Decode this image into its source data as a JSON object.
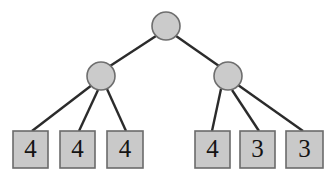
{
  "figure": {
    "name": "game-tree",
    "width": 334,
    "height": 177,
    "background_color": "#ffffff"
  },
  "style": {
    "node_fill": "#cbcbcb",
    "node_stroke": "#6e6e6e",
    "leaf_fill": "#c9c9c9",
    "leaf_stroke": "#6b6b6b",
    "edge_color": "#2b2b2b",
    "label_color": "#141414"
  },
  "nodes": {
    "root": {
      "id": "root",
      "shape": "circle",
      "cx": 166,
      "cy": 26,
      "r": 14,
      "label": ""
    },
    "internal": [
      {
        "id": "left-internal",
        "shape": "circle",
        "cx": 101,
        "cy": 76,
        "r": 14,
        "label": ""
      },
      {
        "id": "right-internal",
        "shape": "circle",
        "cx": 228,
        "cy": 76,
        "r": 14,
        "label": ""
      }
    ],
    "leaves": [
      {
        "id": "leaf-1",
        "shape": "square",
        "x": 13,
        "y": 131,
        "w": 35,
        "h": 37,
        "value": "4"
      },
      {
        "id": "leaf-2",
        "shape": "square",
        "x": 60,
        "y": 131,
        "w": 35,
        "h": 37,
        "value": "4"
      },
      {
        "id": "leaf-3",
        "shape": "square",
        "x": 107,
        "y": 131,
        "w": 36,
        "h": 37,
        "value": "4"
      },
      {
        "id": "leaf-4",
        "shape": "square",
        "x": 195,
        "y": 131,
        "w": 35,
        "h": 37,
        "value": "4"
      },
      {
        "id": "leaf-5",
        "shape": "square",
        "x": 240,
        "y": 131,
        "w": 35,
        "h": 37,
        "value": "3"
      },
      {
        "id": "leaf-6",
        "shape": "square",
        "x": 286,
        "y": 131,
        "w": 37,
        "h": 37,
        "value": "3"
      }
    ]
  },
  "edges": [
    {
      "id": "edge-root-left",
      "from": "root",
      "to": "left-internal",
      "x1": 156,
      "y1": 36,
      "x2": 110,
      "y2": 66
    },
    {
      "id": "edge-root-right",
      "from": "root",
      "to": "right-internal",
      "x1": 176,
      "y1": 36,
      "x2": 219,
      "y2": 66
    },
    {
      "id": "edge-left-leaf1",
      "from": "left-internal",
      "to": "leaf-1",
      "x1": 92,
      "y1": 85,
      "x2": 32,
      "y2": 131
    },
    {
      "id": "edge-left-leaf2",
      "from": "left-internal",
      "to": "leaf-2",
      "x1": 98,
      "y1": 90,
      "x2": 79,
      "y2": 131
    },
    {
      "id": "edge-left-leaf3",
      "from": "left-internal",
      "to": "leaf-3",
      "x1": 107,
      "y1": 89,
      "x2": 126,
      "y2": 131
    },
    {
      "id": "edge-right-leaf4",
      "from": "right-internal",
      "to": "leaf-4",
      "x1": 221,
      "y1": 89,
      "x2": 212,
      "y2": 131
    },
    {
      "id": "edge-right-leaf5",
      "from": "right-internal",
      "to": "leaf-5",
      "x1": 232,
      "y1": 90,
      "x2": 259,
      "y2": 131
    },
    {
      "id": "edge-right-leaf6",
      "from": "right-internal",
      "to": "leaf-6",
      "x1": 238,
      "y1": 85,
      "x2": 303,
      "y2": 131
    }
  ]
}
